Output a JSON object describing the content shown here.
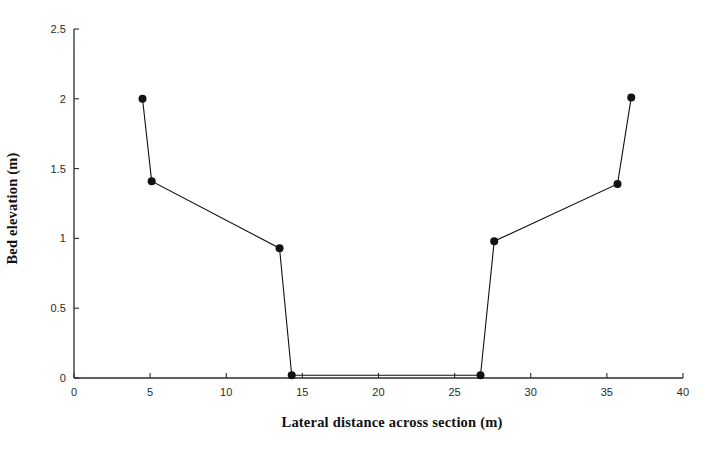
{
  "chart_data": {
    "type": "line",
    "title": "",
    "xlabel": "Lateral distance across section (m)",
    "ylabel": "Bed elevation (m)",
    "xlim": [
      0,
      40
    ],
    "ylim": [
      0,
      2.5
    ],
    "xticks": [
      0,
      5,
      10,
      15,
      20,
      25,
      30,
      35,
      40
    ],
    "xtick_labels": [
      "0",
      "5",
      "10",
      "15",
      "20",
      "25",
      "30",
      "35",
      "40"
    ],
    "yticks": [
      0,
      0.5,
      1,
      1.5,
      2,
      2.5
    ],
    "ytick_labels": [
      "0",
      "0.5",
      "1",
      "1.5",
      "2",
      "2.5"
    ],
    "grid": false,
    "legend": false,
    "marker": "filled-circle",
    "marker_color": "#111111",
    "line_color": "#111111",
    "line_width": 1.1,
    "series": [
      {
        "name": "Bed elevation",
        "x": [
          4.5,
          5.1,
          13.5,
          14.3,
          26.7,
          27.6,
          35.7,
          36.6
        ],
        "y": [
          2.0,
          1.41,
          0.93,
          0.02,
          0.02,
          0.98,
          1.39,
          2.01
        ]
      }
    ]
  }
}
